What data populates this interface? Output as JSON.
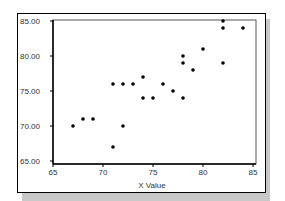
{
  "chart_data": {
    "type": "scatter",
    "title": "",
    "xlabel": "X Value",
    "ylabel": "",
    "xlim": [
      65,
      85
    ],
    "ylim": [
      65,
      85
    ],
    "x_ticks": [
      "65",
      "70",
      "75",
      "80",
      "85"
    ],
    "y_ticks": [
      "65.00",
      "70.00",
      "75.00",
      "80.00",
      "85.00"
    ],
    "grid": false,
    "legend": null,
    "series": [
      {
        "name": "points",
        "color": "#000000",
        "points": [
          [
            67,
            70
          ],
          [
            68,
            71
          ],
          [
            69,
            71
          ],
          [
            71,
            67
          ],
          [
            72,
            70
          ],
          [
            71,
            76
          ],
          [
            72,
            76
          ],
          [
            73,
            76
          ],
          [
            74,
            77
          ],
          [
            74,
            74
          ],
          [
            75,
            74
          ],
          [
            76,
            76
          ],
          [
            77,
            75
          ],
          [
            78,
            74
          ],
          [
            78,
            80
          ],
          [
            78,
            79
          ],
          [
            79,
            78
          ],
          [
            80,
            81
          ],
          [
            82,
            85
          ],
          [
            82,
            84
          ],
          [
            82,
            79
          ],
          [
            84,
            84
          ]
        ]
      }
    ]
  },
  "colors": {
    "shadow": "#c8c8c8",
    "axis": "#000000",
    "marker": "#000000"
  }
}
